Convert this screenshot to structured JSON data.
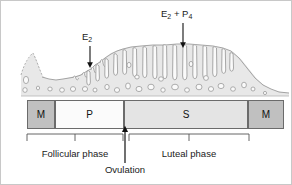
{
  "figure": {
    "background_color": "#ffffff",
    "border_color": "#c8c8c8"
  },
  "hormone_labels": [
    {
      "id": "e2",
      "text": "E",
      "subscript": "2",
      "full_text": "E2",
      "x": 85,
      "y": 36,
      "arrow_from_y": 46,
      "arrow_to_y": 66,
      "arrow_x": 89
    },
    {
      "id": "e2-p4",
      "text_parts": [
        "E",
        "2",
        " + P",
        "4"
      ],
      "full_text": "E2 + P4",
      "x": 163,
      "y": 12,
      "arrow_from_y": 22,
      "arrow_to_y": 46,
      "arrow_x": 182
    }
  ],
  "phase_bar": {
    "left": 26,
    "right": 283,
    "top": 99,
    "height": 29,
    "segments": [
      {
        "label": "M",
        "name": "menstrual-left",
        "x": 26,
        "width": 28,
        "fill": "#c0c0c0"
      },
      {
        "label": "P",
        "name": "proliferative",
        "x": 54,
        "width": 69,
        "fill": "#fbfbfb"
      },
      {
        "label": "S",
        "name": "secretory",
        "x": 123,
        "width": 124,
        "fill": "#e4e4e4"
      },
      {
        "label": "M",
        "name": "menstrual-right",
        "x": 247,
        "width": 36,
        "fill": "#c0c0c0"
      }
    ]
  },
  "brackets": [
    {
      "id": "follicular",
      "label": "Follicular phase",
      "x_start": 26,
      "x_end": 122,
      "y": 133,
      "tick_y": 140,
      "label_x": 74,
      "label_y": 152
    },
    {
      "id": "luteal",
      "label": "Luteal phase",
      "x_start": 128,
      "x_end": 248,
      "y": 133,
      "tick_y": 140,
      "label_x": 188,
      "label_y": 152
    }
  ],
  "ovulation": {
    "label": "Ovulation",
    "arrow_x": 124,
    "arrow_top_y": 130,
    "arrow_bottom_y": 162,
    "label_x": 124,
    "label_y": 167
  },
  "colors": {
    "menstrual_fill": "#c0c0c0",
    "proliferative_fill": "#fbfbfb",
    "secretory_fill": "#e4e4e4",
    "bar_stroke": "#6b6b6b",
    "tissue_fill": "#e8e8e8",
    "tissue_stroke": "#9a9a9a",
    "gland_fill": "#fafafa",
    "text": "#1a1a1a"
  }
}
